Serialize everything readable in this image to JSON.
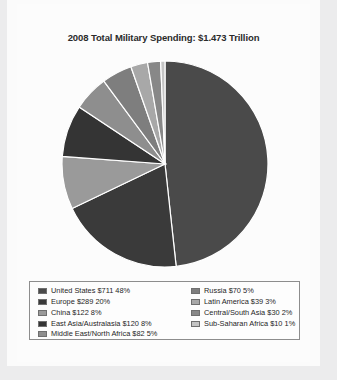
{
  "figure": {
    "title": "2008 Total Military Spending: $1.473 Trillion",
    "caption": ""
  },
  "chart_data": {
    "type": "pie",
    "title": "2008 Total Military Spending: $1.473 Trillion",
    "total_label": "$1.473 Trillion",
    "unit": "billions of US dollars",
    "legend_position": "bottom",
    "start_angle_oclock": 12,
    "direction": "clockwise",
    "categories": [
      "United States",
      "Europe",
      "China",
      "East Asia/Australasia",
      "Middle East/North Africa",
      "Russia",
      "Latin America",
      "Central/South Asia",
      "Sub-Saharan Africa"
    ],
    "values": [
      711,
      289,
      122,
      120,
      82,
      70,
      39,
      30,
      10
    ],
    "percents": [
      48,
      20,
      8,
      8,
      5,
      5,
      3,
      2,
      1
    ],
    "colors": [
      "#4a4a4a",
      "#3a3a3a",
      "#9a9a9a",
      "#343434",
      "#8e8e8e",
      "#7e7e7e",
      "#a8a8a8",
      "#888888",
      "#c4c4c4"
    ]
  },
  "legend": {
    "left_items": [
      {
        "label": "United States $711 48%",
        "color": "#4a4a4a"
      },
      {
        "label": "Europe $289 20%",
        "color": "#3a3a3a"
      },
      {
        "label": "China $122 8%",
        "color": "#9a9a9a"
      },
      {
        "label": "East Asia/Australasia $120 8%",
        "color": "#343434"
      },
      {
        "label": "Middle East/North Africa $82 5%",
        "color": "#8e8e8e"
      }
    ],
    "right_items": [
      {
        "label": "Russia $70 5%",
        "color": "#7e7e7e"
      },
      {
        "label": "Latin America $39 3%",
        "color": "#a8a8a8"
      },
      {
        "label": "Central/South Asia $30 2%",
        "color": "#888888"
      },
      {
        "label": "Sub-Saharan Africa $10 1%",
        "color": "#c4c4c4"
      }
    ]
  }
}
